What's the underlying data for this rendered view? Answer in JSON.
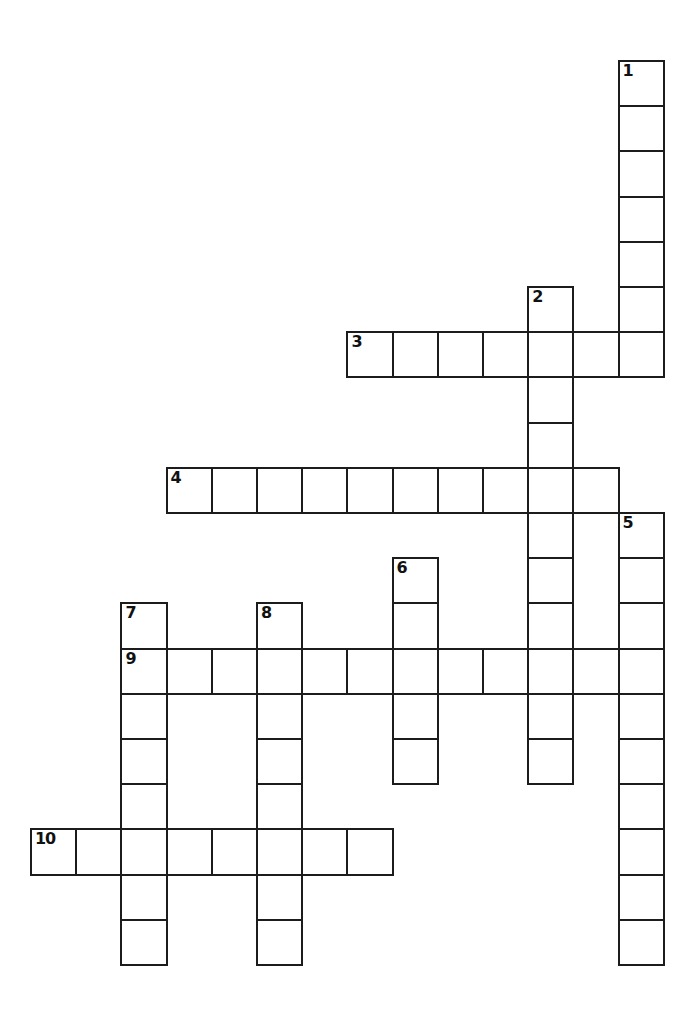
{
  "page": {
    "type": "crossword-puzzle-grid",
    "background_color": "#ffffff",
    "grid_line_color": "#1c1c1c",
    "cell_fill_color": "#ffffff",
    "number_color": "#111111",
    "width_px": 696,
    "height_px": 1030
  },
  "grid": {
    "cell_size_px": 45.2,
    "origin_x_px": 30,
    "origin_y_px": 60,
    "columns": 14,
    "rows": 21,
    "total_entries": 10,
    "total_cells": 97
  },
  "entries": [
    {
      "number": "1",
      "direction": "down",
      "length": 7,
      "start_col": 13,
      "start_row": 0
    },
    {
      "number": "2",
      "direction": "down",
      "length": 11,
      "start_col": 11,
      "start_row": 5
    },
    {
      "number": "3",
      "direction": "across",
      "length": 7,
      "start_col": 7,
      "start_row": 6
    },
    {
      "number": "4",
      "direction": "across",
      "length": 10,
      "start_col": 3,
      "start_row": 9
    },
    {
      "number": "5",
      "direction": "down",
      "length": 10,
      "start_col": 13,
      "start_row": 10
    },
    {
      "number": "6",
      "direction": "down",
      "length": 5,
      "start_col": 8,
      "start_row": 11
    },
    {
      "number": "7",
      "direction": "down",
      "length": 8,
      "start_col": 2,
      "start_row": 12
    },
    {
      "number": "8",
      "direction": "down",
      "length": 8,
      "start_col": 5,
      "start_row": 12
    },
    {
      "number": "9",
      "direction": "across",
      "length": 12,
      "start_col": 2,
      "start_row": 13
    },
    {
      "number": "10",
      "direction": "across",
      "length": 8,
      "start_col": 0,
      "start_row": 17
    }
  ],
  "cells": [
    {
      "col": 13,
      "row": 0,
      "number": "1"
    },
    {
      "col": 13,
      "row": 1,
      "number": ""
    },
    {
      "col": 13,
      "row": 2,
      "number": ""
    },
    {
      "col": 13,
      "row": 3,
      "number": ""
    },
    {
      "col": 13,
      "row": 4,
      "number": ""
    },
    {
      "col": 13,
      "row": 5,
      "number": ""
    },
    {
      "col": 11,
      "row": 5,
      "number": "2"
    },
    {
      "col": 7,
      "row": 6,
      "number": "3"
    },
    {
      "col": 8,
      "row": 6,
      "number": ""
    },
    {
      "col": 9,
      "row": 6,
      "number": ""
    },
    {
      "col": 10,
      "row": 6,
      "number": ""
    },
    {
      "col": 11,
      "row": 6,
      "number": ""
    },
    {
      "col": 12,
      "row": 6,
      "number": ""
    },
    {
      "col": 13,
      "row": 6,
      "number": ""
    },
    {
      "col": 11,
      "row": 7,
      "number": ""
    },
    {
      "col": 11,
      "row": 8,
      "number": ""
    },
    {
      "col": 3,
      "row": 9,
      "number": "4"
    },
    {
      "col": 4,
      "row": 9,
      "number": ""
    },
    {
      "col": 5,
      "row": 9,
      "number": ""
    },
    {
      "col": 6,
      "row": 9,
      "number": ""
    },
    {
      "col": 7,
      "row": 9,
      "number": ""
    },
    {
      "col": 8,
      "row": 9,
      "number": ""
    },
    {
      "col": 9,
      "row": 9,
      "number": ""
    },
    {
      "col": 10,
      "row": 9,
      "number": ""
    },
    {
      "col": 11,
      "row": 9,
      "number": ""
    },
    {
      "col": 12,
      "row": 9,
      "number": ""
    },
    {
      "col": 13,
      "row": 10,
      "number": "5"
    },
    {
      "col": 11,
      "row": 10,
      "number": ""
    },
    {
      "col": 8,
      "row": 11,
      "number": "6"
    },
    {
      "col": 11,
      "row": 11,
      "number": ""
    },
    {
      "col": 13,
      "row": 11,
      "number": ""
    },
    {
      "col": 2,
      "row": 12,
      "number": "7"
    },
    {
      "col": 5,
      "row": 12,
      "number": "8"
    },
    {
      "col": 8,
      "row": 12,
      "number": ""
    },
    {
      "col": 11,
      "row": 12,
      "number": ""
    },
    {
      "col": 13,
      "row": 12,
      "number": ""
    },
    {
      "col": 2,
      "row": 13,
      "number": "9"
    },
    {
      "col": 3,
      "row": 13,
      "number": ""
    },
    {
      "col": 4,
      "row": 13,
      "number": ""
    },
    {
      "col": 5,
      "row": 13,
      "number": ""
    },
    {
      "col": 6,
      "row": 13,
      "number": ""
    },
    {
      "col": 7,
      "row": 13,
      "number": ""
    },
    {
      "col": 8,
      "row": 13,
      "number": ""
    },
    {
      "col": 9,
      "row": 13,
      "number": ""
    },
    {
      "col": 10,
      "row": 13,
      "number": ""
    },
    {
      "col": 11,
      "row": 13,
      "number": ""
    },
    {
      "col": 12,
      "row": 13,
      "number": ""
    },
    {
      "col": 13,
      "row": 13,
      "number": ""
    },
    {
      "col": 2,
      "row": 14,
      "number": ""
    },
    {
      "col": 5,
      "row": 14,
      "number": ""
    },
    {
      "col": 8,
      "row": 14,
      "number": ""
    },
    {
      "col": 11,
      "row": 14,
      "number": ""
    },
    {
      "col": 13,
      "row": 14,
      "number": ""
    },
    {
      "col": 2,
      "row": 15,
      "number": ""
    },
    {
      "col": 5,
      "row": 15,
      "number": ""
    },
    {
      "col": 8,
      "row": 15,
      "number": ""
    },
    {
      "col": 11,
      "row": 15,
      "number": ""
    },
    {
      "col": 13,
      "row": 15,
      "number": ""
    },
    {
      "col": 2,
      "row": 16,
      "number": ""
    },
    {
      "col": 5,
      "row": 16,
      "number": ""
    },
    {
      "col": 13,
      "row": 16,
      "number": ""
    },
    {
      "col": 0,
      "row": 17,
      "number": "10"
    },
    {
      "col": 1,
      "row": 17,
      "number": ""
    },
    {
      "col": 2,
      "row": 17,
      "number": ""
    },
    {
      "col": 3,
      "row": 17,
      "number": ""
    },
    {
      "col": 4,
      "row": 17,
      "number": ""
    },
    {
      "col": 5,
      "row": 17,
      "number": ""
    },
    {
      "col": 6,
      "row": 17,
      "number": ""
    },
    {
      "col": 7,
      "row": 17,
      "number": ""
    },
    {
      "col": 13,
      "row": 17,
      "number": ""
    },
    {
      "col": 2,
      "row": 18,
      "number": ""
    },
    {
      "col": 5,
      "row": 18,
      "number": ""
    },
    {
      "col": 13,
      "row": 18,
      "number": ""
    },
    {
      "col": 2,
      "row": 19,
      "number": ""
    },
    {
      "col": 5,
      "row": 19,
      "number": ""
    },
    {
      "col": 13,
      "row": 19,
      "number": ""
    }
  ]
}
